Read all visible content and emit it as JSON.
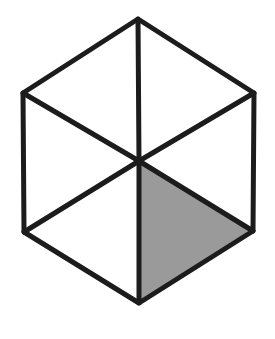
{
  "figure": {
    "shape_name": "regular hexagon",
    "sector_count": 6,
    "shaded_count": 1,
    "unshaded_count": 5,
    "fraction_shaded": "1/6",
    "background_color": "#ffffff",
    "line_color": "#1c1c1c",
    "shaded_color": "#9a9a9a",
    "unshaded_color": "#ffffff",
    "stroke_width": 5,
    "canvas": {
      "width": 275,
      "height": 339
    },
    "center": {
      "x": 139,
      "y": 161
    },
    "vertices": [
      {
        "name": "top",
        "x": 138,
        "y": 19
      },
      {
        "name": "upper-right",
        "x": 254,
        "y": 93
      },
      {
        "name": "lower-right",
        "x": 253,
        "y": 231
      },
      {
        "name": "bottom",
        "x": 139,
        "y": 303
      },
      {
        "name": "lower-left",
        "x": 24,
        "y": 232
      },
      {
        "name": "upper-left",
        "x": 23,
        "y": 93
      }
    ],
    "sectors": [
      {
        "id": "sector-top-right",
        "points": "139,161 138,19 254,93",
        "shaded": false
      },
      {
        "id": "sector-right",
        "points": "139,161 254,93 253,231",
        "shaded": false
      },
      {
        "id": "sector-bottom-right",
        "points": "139,161 253,231 139,303",
        "shaded": true
      },
      {
        "id": "sector-bottom-left",
        "points": "139,161 139,303 24,232",
        "shaded": false
      },
      {
        "id": "sector-left",
        "points": "139,161 24,232 23,93",
        "shaded": false
      },
      {
        "id": "sector-top-left",
        "points": "139,161 23,93 138,19",
        "shaded": false
      }
    ],
    "spokes": [
      {
        "id": "spoke-to-top",
        "x1": 139,
        "y1": 161,
        "x2": 138,
        "y2": 19
      },
      {
        "id": "spoke-to-upper-right",
        "x1": 139,
        "y1": 161,
        "x2": 254,
        "y2": 93
      },
      {
        "id": "spoke-to-lower-right",
        "x1": 139,
        "y1": 161,
        "x2": 253,
        "y2": 231
      },
      {
        "id": "spoke-to-bottom",
        "x1": 139,
        "y1": 161,
        "x2": 139,
        "y2": 303
      },
      {
        "id": "spoke-to-lower-left",
        "x1": 139,
        "y1": 161,
        "x2": 24,
        "y2": 232
      },
      {
        "id": "spoke-to-upper-left",
        "x1": 139,
        "y1": 161,
        "x2": 23,
        "y2": 93
      }
    ],
    "outline_points": "138,19 254,93 253,231 139,303 24,232 23,93"
  }
}
